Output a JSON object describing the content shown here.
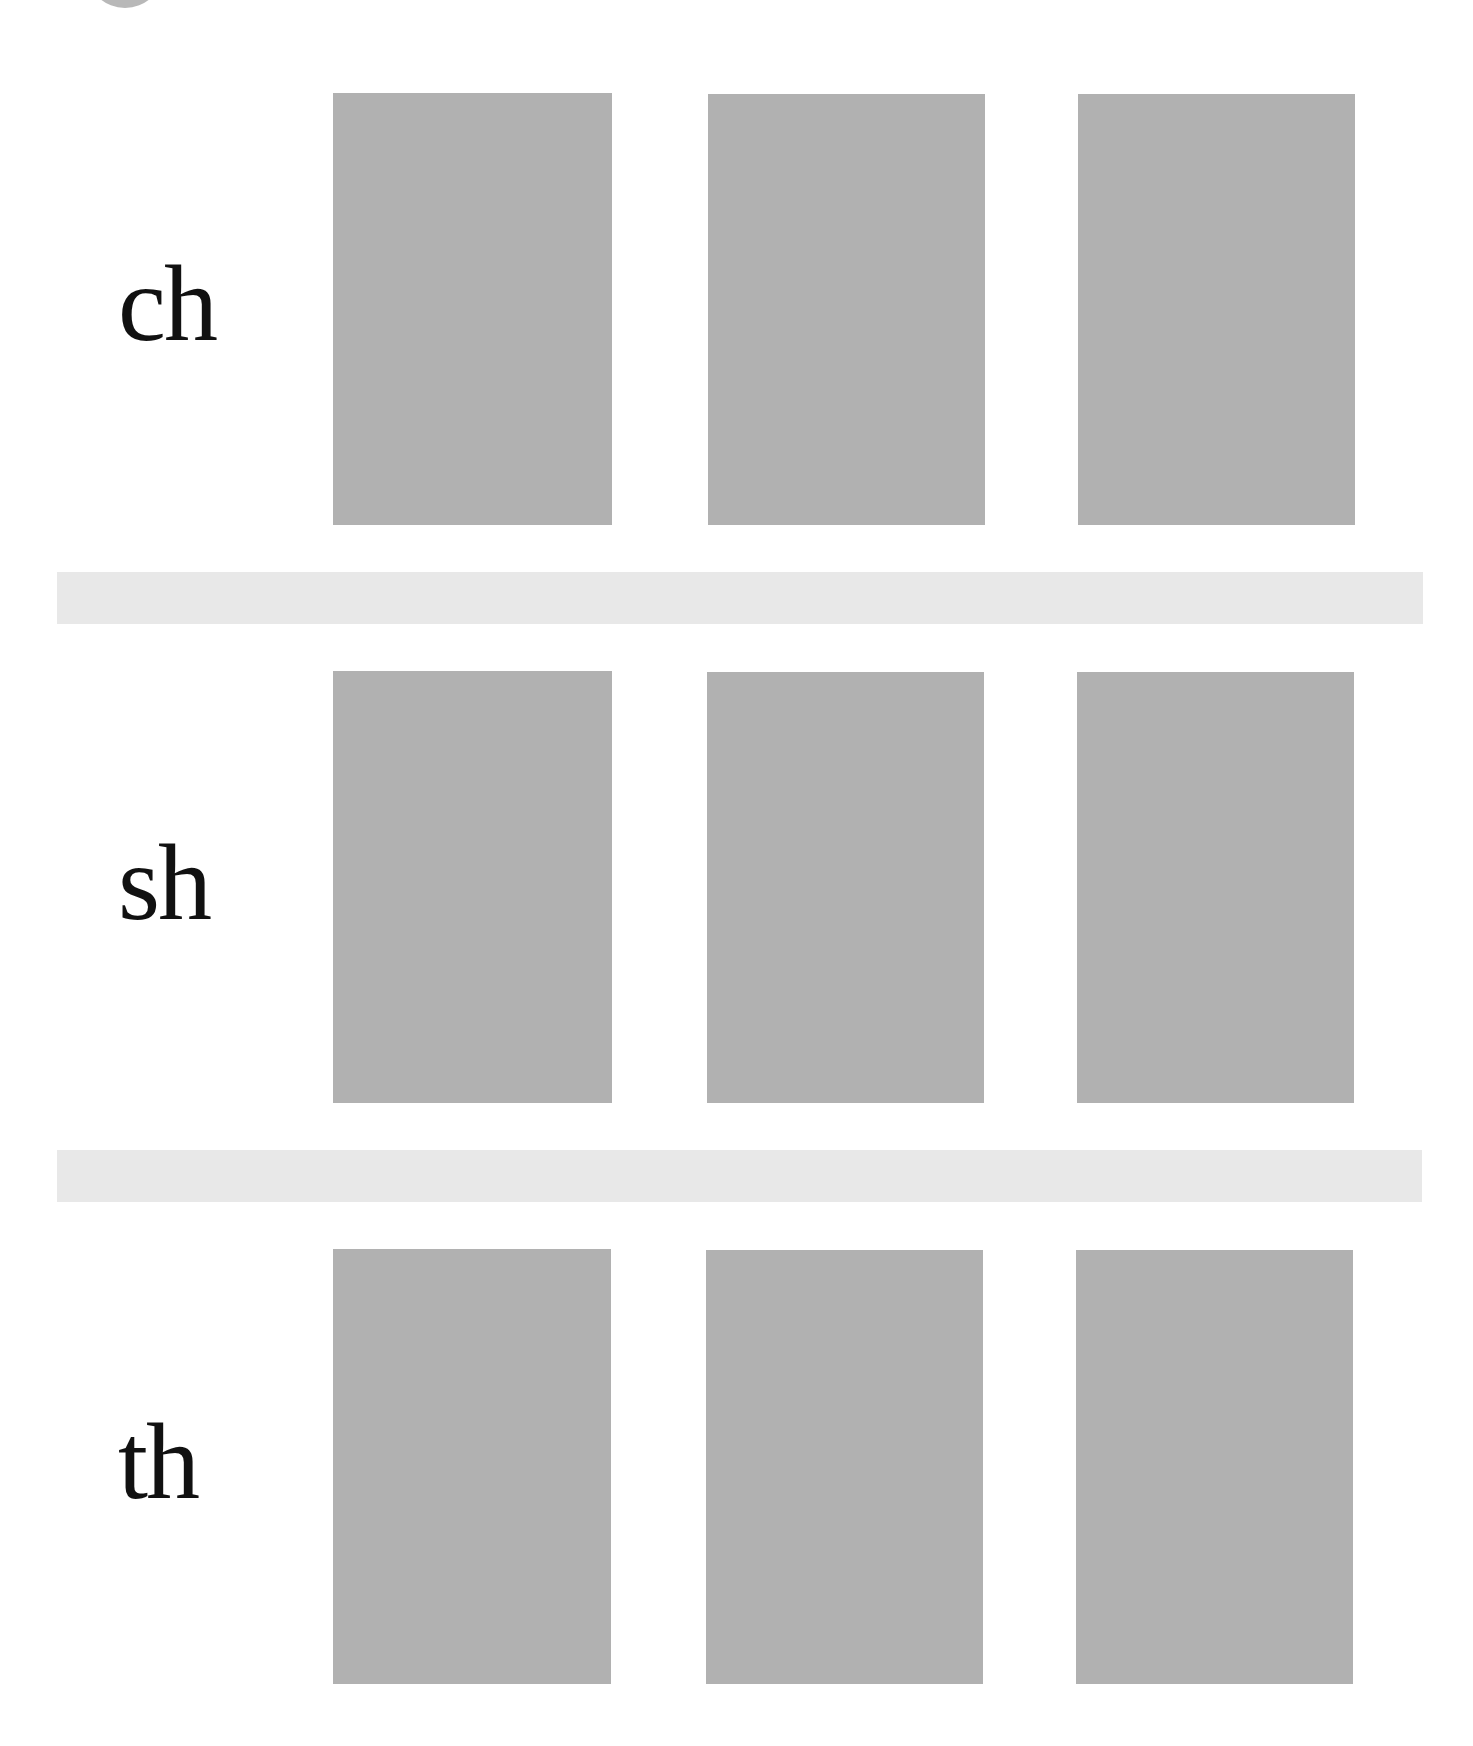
{
  "page": {
    "decoration": {
      "corner_circle_color": "#b8b8b8"
    },
    "colors": {
      "box_fill": "#b1b1b1",
      "divider_fill": "#e8e8e8",
      "text": "#111111",
      "background": "#ffffff"
    },
    "rows": [
      {
        "label": "ch",
        "boxes": [
          "",
          "",
          ""
        ]
      },
      {
        "label": "sh",
        "boxes": [
          "",
          "",
          ""
        ]
      },
      {
        "label": "th",
        "boxes": [
          "",
          "",
          ""
        ]
      }
    ]
  }
}
